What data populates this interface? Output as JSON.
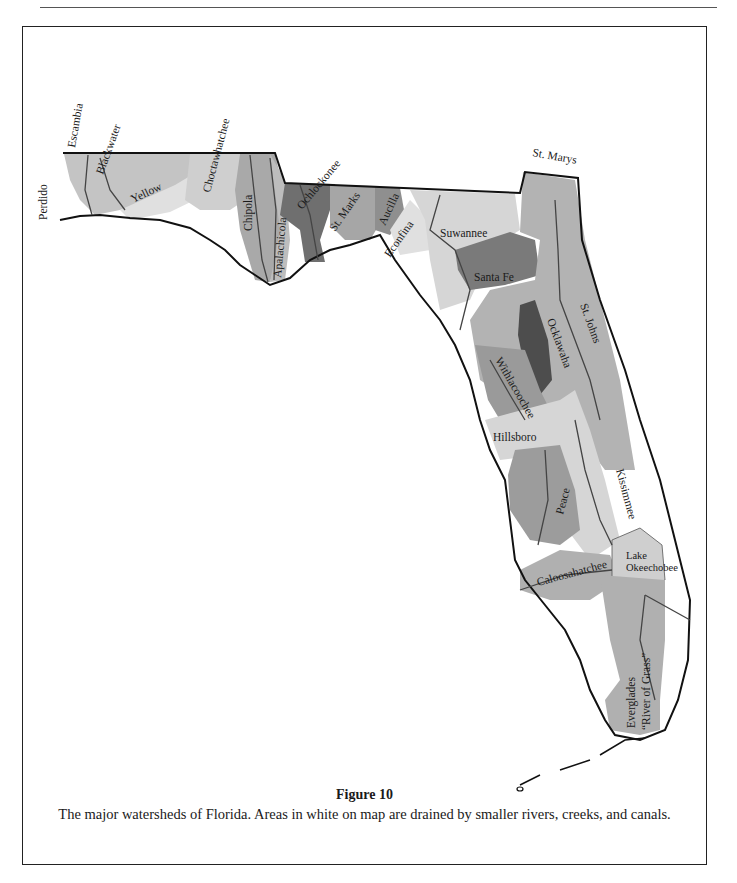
{
  "figure": {
    "title": "Figure 10",
    "caption": "The major watersheds of Florida. Areas in white on map are drained by smaller rivers, creeks, and canals."
  },
  "map": {
    "subject": "Florida major watersheds",
    "colors": {
      "light": "#d9d9d9",
      "medium": "#bdbdbd",
      "medium_dark": "#a3a3a3",
      "dark": "#7e7e7e",
      "darkest": "#555555",
      "outline": "#111111",
      "river": "#444444"
    },
    "labels": {
      "perdido": "Perdido",
      "escambia": "Escambia",
      "blackwater": "Blackwater",
      "yellow": "Yellow",
      "choctawhatchee": "Choctawhatchee",
      "chipola": "Chipola",
      "apalachicola": "Apalachicola",
      "ochlockonee": "Ochlockonee",
      "st_marks": "St. Marks",
      "aucilla": "Aucilla",
      "econfina": "Econfina",
      "suwannee": "Suwannee",
      "santa_fe": "Santa Fe",
      "st_marys": "St. Marys",
      "st_johns": "St. Johns",
      "ocklawaha": "Ocklawaha",
      "withlacoochee": "Withlacoochee",
      "hillsboro": "Hillsboro",
      "peace": "Peace",
      "kissimmee": "Kissimmee",
      "lake_okeechobee_1": "Lake",
      "lake_okeechobee_2": "Okeechobee",
      "caloosahatchee": "Caloosahatchee",
      "everglades": "Everglades",
      "river_of_grass": "“River of Grass”"
    }
  }
}
